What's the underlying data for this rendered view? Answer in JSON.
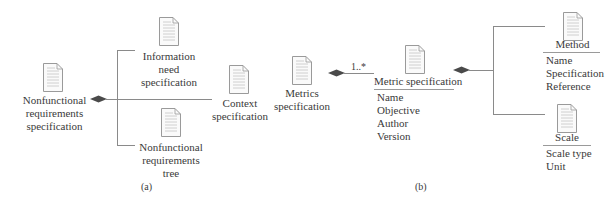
{
  "figure_a": {
    "caption": "(a)",
    "root": {
      "label_lines": [
        "Nonfunctional",
        "requirements",
        "specification"
      ],
      "icon": "document-icon"
    },
    "children": [
      {
        "label_lines": [
          "Information",
          "need",
          "specification"
        ],
        "icon": "document-icon"
      },
      {
        "label_lines": [
          "Context",
          "specification"
        ],
        "icon": "document-icon"
      },
      {
        "label_lines": [
          "Nonfunctional",
          "requirements",
          "tree"
        ],
        "icon": "document-icon"
      }
    ]
  },
  "figure_b": {
    "caption": "(b)",
    "root": {
      "label_lines": [
        "Metrics",
        "specification"
      ],
      "icon": "document-icon"
    },
    "multiplicity": "1..*",
    "metric_class": {
      "name": "Metric specification",
      "attributes": [
        "Name",
        "Objective",
        "Author",
        "Version"
      ],
      "icon": "document-icon"
    },
    "method_class": {
      "name": "Method",
      "attributes": [
        "Name",
        "Specification",
        "Reference"
      ],
      "icon": "document-icon"
    },
    "scale_class": {
      "name": "Scale",
      "attributes": [
        "Scale type",
        "Unit"
      ],
      "icon": "document-icon"
    }
  },
  "colors": {
    "text": "#3a3a3a",
    "line": "#8a8a8a",
    "diamond": "#4a4a4a",
    "icon_stroke": "#9a9a9a"
  }
}
